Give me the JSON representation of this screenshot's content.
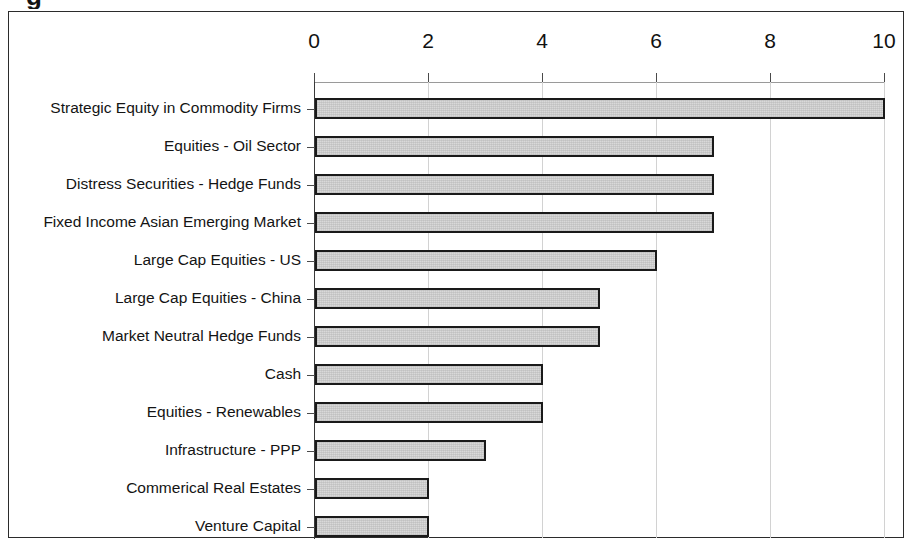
{
  "title_fragment": "g",
  "chart_data": {
    "type": "bar",
    "orientation": "horizontal",
    "title": "",
    "subtitle": "",
    "xlabel": "",
    "ylabel": "",
    "xlim": [
      0,
      10
    ],
    "grid": true,
    "legend": "none",
    "x_tick_labels": [
      "0",
      "2",
      "4",
      "6",
      "8",
      "10"
    ],
    "x_ticks": [
      0,
      2,
      4,
      6,
      8,
      10
    ],
    "categories": [
      "Strategic Equity in Commodity Firms",
      "Equities - Oil Sector",
      "Distress Securities - Hedge Funds",
      "Fixed Income Asian Emerging Market",
      "Large Cap Equities - US",
      "Large Cap Equities - China",
      "Market Neutral Hedge Funds",
      "Cash",
      "Equities - Renewables",
      "Infrastructure - PPP",
      "Commerical Real Estates",
      "Venture Capital"
    ],
    "values": [
      10,
      7,
      7,
      7,
      6,
      5,
      5,
      4,
      4,
      3,
      2,
      2
    ],
    "bar_fill_color": "#c9c9c9",
    "bar_border_color": "#1a1a1a",
    "frame_color": "#2b2b2b",
    "grid_color": "#d2d2d2"
  }
}
